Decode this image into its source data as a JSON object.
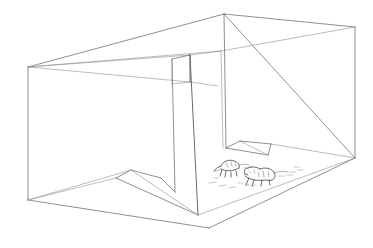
{
  "image": {
    "title": "Perspective line drawing of an empty room interior",
    "subject": "interior-room-perspective-sketch",
    "medium": "pen-and-ink line drawing",
    "background_color": "#ffffff",
    "line_color": "#5b5f66",
    "faint_line_color": "#8c9097",
    "creature_line_color": "#3b3b40",
    "canvas": {
      "width": 373,
      "height": 248
    }
  },
  "scene": {
    "description": "A large rectangular box-like room drawn in linear perspective, open toward the viewer, containing interior partition walls and two small animal figures on the floor at right.",
    "elements": [
      {
        "name": "outer-room-shell",
        "label": "Outer room shell"
      },
      {
        "name": "ceiling-plane",
        "label": "Ceiling plane"
      },
      {
        "name": "floor-plane",
        "label": "Floor plane"
      },
      {
        "name": "left-wall",
        "label": "Left wall"
      },
      {
        "name": "right-wall",
        "label": "Right wall"
      },
      {
        "name": "center-partition-wall",
        "label": "Center partition wall"
      },
      {
        "name": "right-partition-wall",
        "label": "Right partition wall"
      },
      {
        "name": "creature-left",
        "label": "Small animal figure (left)"
      },
      {
        "name": "creature-right",
        "label": "Small animal figure (right)"
      }
    ]
  },
  "geometry": {
    "vertices": {
      "left_top_corner": "28,67",
      "left_bottom_corner": "28,200",
      "top_apex": "224,14",
      "right_top_corner": "355,27",
      "right_bottom_corner": "355,158",
      "bottom_apex": "209,228",
      "center_partition_top": "190,55",
      "center_partition_foot": "198,215"
    }
  },
  "creatures": {
    "count": 2,
    "items": [
      {
        "name": "creature-left",
        "label": "animal figure left",
        "x": 228,
        "y": 167
      },
      {
        "name": "creature-right",
        "label": "animal figure right",
        "x": 258,
        "y": 175
      }
    ]
  }
}
